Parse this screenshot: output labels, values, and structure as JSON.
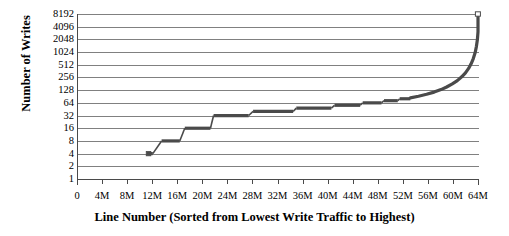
{
  "chart_data": {
    "type": "line",
    "title": "",
    "xlabel": "Line Number (Sorted from Lowest Write Traffic to Highest)",
    "ylabel": "Number of Writes",
    "yscale": "log2",
    "ylim": [
      1,
      8192
    ],
    "xlim": [
      0,
      64000000
    ],
    "grid": true,
    "legend": null,
    "marker_color": "#4a4a4a",
    "grid_color": "#808080",
    "axis_color": "#4a4a4a",
    "y_ticks": [
      {
        "label": "8192",
        "value": 8192
      },
      {
        "label": "4096",
        "value": 4096
      },
      {
        "label": "2048",
        "value": 2048
      },
      {
        "label": "1024",
        "value": 1024
      },
      {
        "label": "512",
        "value": 512
      },
      {
        "label": "256",
        "value": 256
      },
      {
        "label": "128",
        "value": 128
      },
      {
        "label": "64",
        "value": 64
      },
      {
        "label": "32",
        "value": 32
      },
      {
        "label": "16",
        "value": 16
      },
      {
        "label": "8",
        "value": 8
      },
      {
        "label": "4",
        "value": 4
      },
      {
        "label": "2",
        "value": 2
      },
      {
        "label": "1",
        "value": 1
      }
    ],
    "x_ticks": [
      {
        "label": "0",
        "value": 0
      },
      {
        "label": "4M",
        "value": 4000000
      },
      {
        "label": "8M",
        "value": 8000000
      },
      {
        "label": "12M",
        "value": 12000000
      },
      {
        "label": "16M",
        "value": 16000000
      },
      {
        "label": "20M",
        "value": 20000000
      },
      {
        "label": "24M",
        "value": 24000000
      },
      {
        "label": "28M",
        "value": 28000000
      },
      {
        "label": "32M",
        "value": 32000000
      },
      {
        "label": "36M",
        "value": 36000000
      },
      {
        "label": "40M",
        "value": 40000000
      },
      {
        "label": "44M",
        "value": 44000000
      },
      {
        "label": "48M",
        "value": 48000000
      },
      {
        "label": "52M",
        "value": 52000000
      },
      {
        "label": "56M",
        "value": 56000000
      },
      {
        "label": "60M",
        "value": 60000000
      },
      {
        "label": "64M",
        "value": 64000000
      }
    ],
    "steps": [
      {
        "x_start": 11400000,
        "x_end": 12100000,
        "y": 4
      },
      {
        "x_start": 13500000,
        "x_end": 16400000,
        "y": 8
      },
      {
        "x_start": 17200000,
        "x_end": 21300000,
        "y": 16
      },
      {
        "x_start": 21800000,
        "x_end": 27400000,
        "y": 32
      },
      {
        "x_start": 28100000,
        "x_end": 34500000,
        "y": 40
      },
      {
        "x_start": 35000000,
        "x_end": 40600000,
        "y": 48
      },
      {
        "x_start": 41100000,
        "x_end": 45200000,
        "y": 56
      },
      {
        "x_start": 45600000,
        "x_end": 48600000,
        "y": 64
      },
      {
        "x_start": 49000000,
        "x_end": 51200000,
        "y": 72
      },
      {
        "x_start": 51500000,
        "x_end": 53200000,
        "y": 80
      }
    ],
    "tail_curve": [
      {
        "x": 53200000,
        "y": 84
      },
      {
        "x": 54500000,
        "y": 92
      },
      {
        "x": 55800000,
        "y": 102
      },
      {
        "x": 57000000,
        "y": 115
      },
      {
        "x": 58100000,
        "y": 132
      },
      {
        "x": 59000000,
        "y": 152
      },
      {
        "x": 59900000,
        "y": 180
      },
      {
        "x": 60700000,
        "y": 215
      },
      {
        "x": 61400000,
        "y": 265
      },
      {
        "x": 62000000,
        "y": 330
      },
      {
        "x": 62500000,
        "y": 420
      },
      {
        "x": 62900000,
        "y": 540
      },
      {
        "x": 63250000,
        "y": 720
      },
      {
        "x": 63550000,
        "y": 1000
      },
      {
        "x": 63750000,
        "y": 1400
      },
      {
        "x": 63900000,
        "y": 2000
      },
      {
        "x": 64000000,
        "y": 3100
      },
      {
        "x": 64000000,
        "y": 5000
      },
      {
        "x": 64000000,
        "y": 7600
      }
    ],
    "top_marker": {
      "x": 64000000,
      "y": 8192
    }
  }
}
